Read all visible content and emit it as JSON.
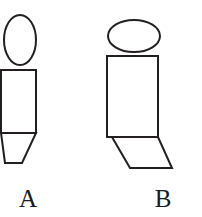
{
  "figure": {
    "background_color": "#ffffff",
    "stroke_color": "#231f20",
    "stroke_width": 2,
    "width": 202,
    "height": 217
  },
  "labels": {
    "a": "A",
    "b": "B"
  },
  "shapes": {
    "figure_a": {
      "name": "A",
      "head": {
        "type": "ellipse",
        "cx": 20,
        "cy": 40,
        "rx": 16,
        "ry": 25
      },
      "body": {
        "type": "rect",
        "x": 1,
        "y": 70,
        "width": 35,
        "height": 63
      },
      "foot": {
        "type": "polygon",
        "points": "1,133 36,133 22,163 5,163",
        "orientation": "slants-down-left"
      }
    },
    "figure_b": {
      "name": "B",
      "head": {
        "type": "ellipse",
        "cx": 134,
        "cy": 36,
        "rx": 26,
        "ry": 16
      },
      "body": {
        "type": "rect",
        "x": 107,
        "y": 56,
        "width": 51,
        "height": 81
      },
      "foot": {
        "type": "polygon",
        "points": "112,137 158,137 172,168 130,168",
        "orientation": "slants-down-right"
      }
    }
  }
}
